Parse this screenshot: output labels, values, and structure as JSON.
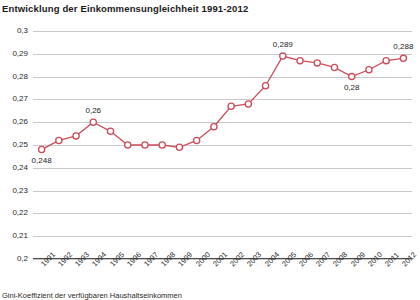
{
  "chart_data": {
    "type": "line",
    "title": "Entwicklung der Einkommensungleichheit 1991-2012",
    "xlabel": "",
    "ylabel": "",
    "ylim": [
      0.2,
      0.3
    ],
    "ytick_labels": [
      "0,3",
      "0,29",
      "0,28",
      "0,27",
      "0,26",
      "0,25",
      "0,24",
      "0,23",
      "0,22",
      "0,21",
      "0,2"
    ],
    "ytick_values": [
      0.3,
      0.29,
      0.28,
      0.27,
      0.26,
      0.25,
      0.24,
      0.23,
      0.22,
      0.21,
      0.2
    ],
    "grid": true,
    "legend": "none",
    "categories": [
      "1991",
      "1992",
      "1993",
      "1994",
      "1995",
      "1996",
      "1997",
      "1998",
      "1999",
      "2000",
      "2001",
      "2002",
      "2003",
      "2004",
      "2005",
      "2006",
      "2007",
      "2008",
      "2009",
      "2010",
      "2011",
      "2012"
    ],
    "values": [
      0.248,
      0.252,
      0.254,
      0.26,
      0.256,
      0.25,
      0.25,
      0.25,
      0.249,
      0.252,
      0.258,
      0.267,
      0.268,
      0.276,
      0.289,
      0.287,
      0.286,
      0.284,
      0.28,
      0.283,
      0.287,
      0.288
    ],
    "series_color": "#cc4d5a",
    "marker": "open-circle",
    "annotations": [
      {
        "category": "1991",
        "value": 0.248,
        "label": "0,248",
        "position": "below"
      },
      {
        "category": "1994",
        "value": 0.26,
        "label": "0,26",
        "position": "above"
      },
      {
        "category": "2005",
        "value": 0.289,
        "label": "0,289",
        "position": "above"
      },
      {
        "category": "2009",
        "value": 0.28,
        "label": "0,28",
        "position": "below"
      },
      {
        "category": "2012",
        "value": 0.288,
        "label": "0,288",
        "position": "above"
      }
    ],
    "footnote": "Gini-Koeffizient der verfügbaren Haushaltseinkommen"
  }
}
